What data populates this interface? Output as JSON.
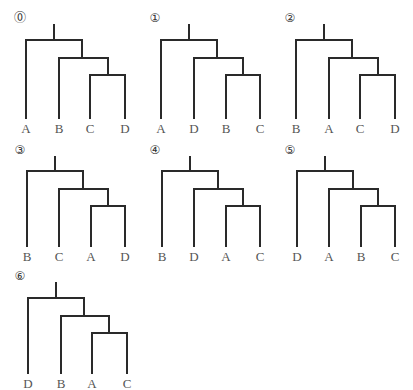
{
  "trees": [
    {
      "number": "⓪",
      "leaves": [
        "A",
        "B",
        "C",
        "D"
      ]
    },
    {
      "number": "①",
      "leaves": [
        "A",
        "D",
        "B",
        "C"
      ]
    },
    {
      "number": "②",
      "leaves": [
        "B",
        "A",
        "C",
        "D"
      ]
    },
    {
      "number": "③",
      "leaves": [
        "B",
        "C",
        "A",
        "D"
      ]
    },
    {
      "number": "④",
      "leaves": [
        "B",
        "D",
        "A",
        "C"
      ]
    },
    {
      "number": "⑤",
      "leaves": [
        "D",
        "A",
        "B",
        "C"
      ]
    },
    {
      "number": "⑥",
      "leaves": [
        "D",
        "B",
        "A",
        "C"
      ]
    }
  ]
}
